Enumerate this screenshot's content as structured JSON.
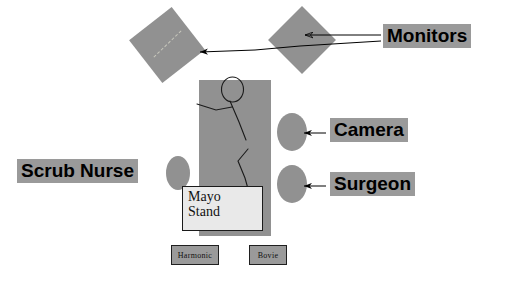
{
  "diagram": {
    "background_color": "#ffffff",
    "shape_fill_color": "#919191",
    "label_highlight_color": "#9a9a9a",
    "line_color": "#000000"
  },
  "labels": {
    "monitors": "Monitors",
    "camera": "Camera",
    "surgeon": "Surgeon",
    "scrub_nurse": "Scrub Nurse"
  },
  "equipment": {
    "mayo_stand_line1": "Mayo",
    "mayo_stand_line2": "Stand",
    "harmonic": "Harmonic",
    "bovie": "Bovie"
  },
  "shapes": {
    "monitor_left": "rotated-square-monitor",
    "monitor_right": "diamond-monitor",
    "operating_table": "operating-table-rectangle",
    "patient": "stick-figure-patient",
    "scrub_nurse_position": "ellipse-person",
    "camera_operator_position": "ellipse-person",
    "surgeon_position": "ellipse-person"
  },
  "annotations": {
    "arrow_monitors_to_right_monitor": "arrow pointing left into right monitor",
    "arrow_monitors_to_left_monitor": "long arrow pointing left into left monitor",
    "arrow_camera": "short arrow pointing left to camera operator ellipse",
    "arrow_surgeon": "short arrow pointing left to surgeon ellipse"
  }
}
